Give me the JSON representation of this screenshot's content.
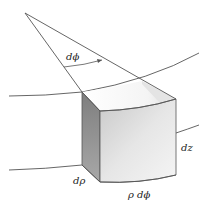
{
  "diagram": {
    "labels": {
      "angle": "dϕ",
      "height": "dz",
      "radial": "dρ",
      "arc": "ρ dϕ"
    },
    "colors": {
      "line": "#555555",
      "front_face_light": "#f4f4f4",
      "front_face_mid": "#d8d8d8",
      "side_face_dark": "#8a8a8a",
      "side_face_mid": "#b5b5b5",
      "top_face": "#f7f7f7",
      "top_shadow": "#e2e2e2"
    }
  }
}
